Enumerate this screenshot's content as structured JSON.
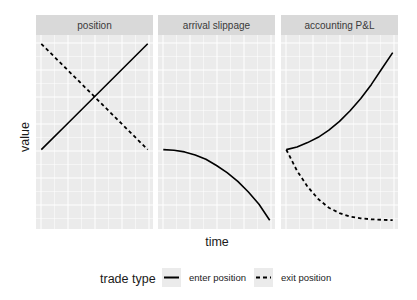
{
  "chart_data": {
    "type": "line",
    "layout": "facet_wrap",
    "xlabel": "time",
    "ylabel": "value",
    "grid": true,
    "axis_ticks_shown": false,
    "legend": {
      "position": "bottom",
      "title": "trade type",
      "entries": [
        {
          "label": "enter position",
          "linetype": "solid"
        },
        {
          "label": "exit position",
          "linetype": "dashed"
        }
      ]
    },
    "panels": [
      {
        "title": "position",
        "series": [
          {
            "name": "enter position",
            "linetype": "solid",
            "x": [
              0,
              0.25,
              0.5,
              0.75,
              1
            ],
            "y": [
              0.45,
              0.6,
              0.75,
              0.9,
              1.05
            ]
          },
          {
            "name": "exit position",
            "linetype": "dashed",
            "x": [
              0,
              0.25,
              0.5,
              0.75,
              1
            ],
            "y": [
              1.05,
              0.9,
              0.75,
              0.6,
              0.45
            ]
          }
        ]
      },
      {
        "title": "arrival slippage",
        "series": [
          {
            "name": "enter position",
            "linetype": "solid",
            "x": [
              0,
              0.1,
              0.2,
              0.3,
              0.4,
              0.5,
              0.6,
              0.7,
              0.8,
              0.9,
              1
            ],
            "y": [
              0.45,
              0.447,
              0.437,
              0.42,
              0.395,
              0.36,
              0.32,
              0.27,
              0.21,
              0.14,
              0.05
            ]
          }
        ]
      },
      {
        "title": "accounting P&L",
        "series": [
          {
            "name": "enter position",
            "linetype": "solid",
            "x": [
              0,
              0.1,
              0.2,
              0.3,
              0.4,
              0.5,
              0.6,
              0.7,
              0.8,
              0.9,
              1
            ],
            "y": [
              0.45,
              0.465,
              0.49,
              0.52,
              0.56,
              0.61,
              0.67,
              0.74,
              0.82,
              0.91,
              1.0
            ]
          },
          {
            "name": "exit position",
            "linetype": "dashed",
            "x": [
              0,
              0.1,
              0.2,
              0.3,
              0.4,
              0.5,
              0.6,
              0.7,
              0.8,
              0.9,
              1
            ],
            "y": [
              0.45,
              0.33,
              0.24,
              0.17,
              0.12,
              0.09,
              0.07,
              0.06,
              0.055,
              0.052,
              0.05
            ]
          }
        ]
      }
    ],
    "ylim": [
      0,
      1.1
    ],
    "xlim": [
      -0.05,
      1.05
    ]
  },
  "colors": {
    "panel_bg": "#ebebeb",
    "strip_bg": "#d9d9d9",
    "grid_line": "#ffffff",
    "series_line": "#000000"
  }
}
